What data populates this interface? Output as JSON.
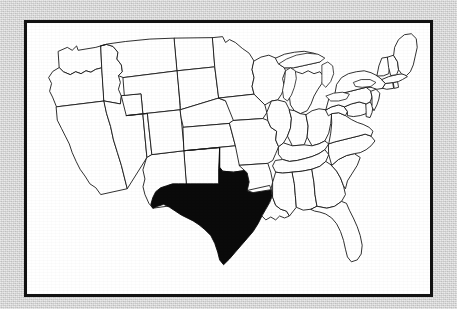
{
  "figure": {
    "kind": "map",
    "background_color": "#d4d4d4",
    "plate_color": "#ffffff",
    "frame_color": "#121212",
    "border_color": "#1a1a1a",
    "highlight_color": "#0a0a0a"
  },
  "map": {
    "name": "contiguous-united-states",
    "projection": "albers-usa-like",
    "highlighted_states": [
      "Texas"
    ],
    "region_count": 49,
    "states": [
      {
        "code": "WA",
        "name": "Washington",
        "highlighted": false
      },
      {
        "code": "OR",
        "name": "Oregon",
        "highlighted": false
      },
      {
        "code": "CA",
        "name": "California",
        "highlighted": false
      },
      {
        "code": "NV",
        "name": "Nevada",
        "highlighted": false
      },
      {
        "code": "ID",
        "name": "Idaho",
        "highlighted": false
      },
      {
        "code": "MT",
        "name": "Montana",
        "highlighted": false
      },
      {
        "code": "WY",
        "name": "Wyoming",
        "highlighted": false
      },
      {
        "code": "UT",
        "name": "Utah",
        "highlighted": false
      },
      {
        "code": "AZ",
        "name": "Arizona",
        "highlighted": false
      },
      {
        "code": "NM",
        "name": "New Mexico",
        "highlighted": false
      },
      {
        "code": "CO",
        "name": "Colorado",
        "highlighted": false
      },
      {
        "code": "ND",
        "name": "North Dakota",
        "highlighted": false
      },
      {
        "code": "SD",
        "name": "South Dakota",
        "highlighted": false
      },
      {
        "code": "NE",
        "name": "Nebraska",
        "highlighted": false
      },
      {
        "code": "KS",
        "name": "Kansas",
        "highlighted": false
      },
      {
        "code": "OK",
        "name": "Oklahoma",
        "highlighted": false
      },
      {
        "code": "TX",
        "name": "Texas",
        "highlighted": true
      },
      {
        "code": "MN",
        "name": "Minnesota",
        "highlighted": false
      },
      {
        "code": "IA",
        "name": "Iowa",
        "highlighted": false
      },
      {
        "code": "MO",
        "name": "Missouri",
        "highlighted": false
      },
      {
        "code": "AR",
        "name": "Arkansas",
        "highlighted": false
      },
      {
        "code": "LA",
        "name": "Louisiana",
        "highlighted": false
      },
      {
        "code": "WI",
        "name": "Wisconsin",
        "highlighted": false
      },
      {
        "code": "IL",
        "name": "Illinois",
        "highlighted": false
      },
      {
        "code": "MI",
        "name": "Michigan",
        "highlighted": false
      },
      {
        "code": "IN",
        "name": "Indiana",
        "highlighted": false
      },
      {
        "code": "OH",
        "name": "Ohio",
        "highlighted": false
      },
      {
        "code": "KY",
        "name": "Kentucky",
        "highlighted": false
      },
      {
        "code": "TN",
        "name": "Tennessee",
        "highlighted": false
      },
      {
        "code": "MS",
        "name": "Mississippi",
        "highlighted": false
      },
      {
        "code": "AL",
        "name": "Alabama",
        "highlighted": false
      },
      {
        "code": "GA",
        "name": "Georgia",
        "highlighted": false
      },
      {
        "code": "FL",
        "name": "Florida",
        "highlighted": false
      },
      {
        "code": "SC",
        "name": "South Carolina",
        "highlighted": false
      },
      {
        "code": "NC",
        "name": "North Carolina",
        "highlighted": false
      },
      {
        "code": "VA",
        "name": "Virginia",
        "highlighted": false
      },
      {
        "code": "WV",
        "name": "West Virginia",
        "highlighted": false
      },
      {
        "code": "MD",
        "name": "Maryland",
        "highlighted": false
      },
      {
        "code": "DE",
        "name": "Delaware",
        "highlighted": false
      },
      {
        "code": "PA",
        "name": "Pennsylvania",
        "highlighted": false
      },
      {
        "code": "NJ",
        "name": "New Jersey",
        "highlighted": false
      },
      {
        "code": "NY",
        "name": "New York",
        "highlighted": false
      },
      {
        "code": "CT",
        "name": "Connecticut",
        "highlighted": false
      },
      {
        "code": "RI",
        "name": "Rhode Island",
        "highlighted": false
      },
      {
        "code": "MA",
        "name": "Massachusetts",
        "highlighted": false
      },
      {
        "code": "VT",
        "name": "Vermont",
        "highlighted": false
      },
      {
        "code": "NH",
        "name": "New Hampshire",
        "highlighted": false
      },
      {
        "code": "ME",
        "name": "Maine",
        "highlighted": false
      }
    ],
    "lakes": [
      {
        "name": "Lake Superior"
      },
      {
        "name": "Lake Michigan"
      },
      {
        "name": "Lake Huron"
      },
      {
        "name": "Lake Erie"
      },
      {
        "name": "Lake Ontario"
      }
    ]
  }
}
